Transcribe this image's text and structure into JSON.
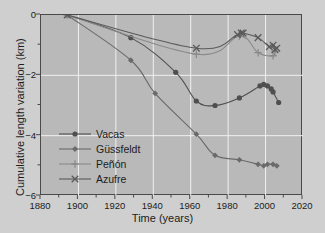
{
  "chart_data": {
    "type": "line",
    "title": "",
    "xlabel": "Time (years)",
    "ylabel": "Cumulative length variation (km)",
    "xlim": [
      1880,
      2020
    ],
    "ylim": [
      -6,
      0
    ],
    "xticks": [
      1880,
      1900,
      1920,
      1940,
      1960,
      1980,
      2000,
      2020
    ],
    "yticks": [
      0,
      -2,
      -4,
      -6
    ],
    "yminorticks": [
      -1,
      -3,
      -5
    ],
    "grid": true,
    "legend_position": "lower left",
    "series": [
      {
        "name": "Vacas",
        "marker": "circle",
        "color": "#4f4f4f",
        "points": [
          [
            1894,
            0.0
          ],
          [
            1928,
            -0.75
          ],
          [
            1952,
            -1.9
          ],
          [
            1963,
            -2.85
          ],
          [
            1973,
            -3.0
          ],
          [
            1986,
            -2.75
          ],
          [
            1997,
            -2.35
          ],
          [
            1999,
            -2.3
          ],
          [
            2001,
            -2.35
          ],
          [
            2003,
            -2.45
          ],
          [
            2004,
            -2.55
          ],
          [
            2007,
            -2.9
          ]
        ]
      },
      {
        "name": "Güssfeldt",
        "marker": "diamond",
        "color": "#6a6a6a",
        "points": [
          [
            1894,
            0.0
          ],
          [
            1928,
            -1.5
          ],
          [
            1941,
            -2.6
          ],
          [
            1963,
            -3.95
          ],
          [
            1973,
            -4.65
          ],
          [
            1986,
            -4.8
          ],
          [
            1996,
            -4.95
          ],
          [
            1999,
            -5.0
          ],
          [
            2001,
            -4.95
          ],
          [
            2004,
            -4.95
          ],
          [
            2006,
            -5.0
          ]
        ]
      },
      {
        "name": "Peñón",
        "marker": "plus",
        "color": "#8a8a8a",
        "points": [
          [
            1894,
            0.0
          ],
          [
            1963,
            -1.3
          ],
          [
            1986,
            -0.7
          ],
          [
            1996,
            -1.25
          ],
          [
            2004,
            -1.35
          ],
          [
            2005,
            -1.2
          ]
        ]
      },
      {
        "name": "Azufre",
        "marker": "x",
        "color": "#5a5a5a",
        "points": [
          [
            1894,
            0.0
          ],
          [
            1963,
            -1.1
          ],
          [
            1985,
            -0.65
          ],
          [
            1987,
            -0.6
          ],
          [
            1988,
            -0.6
          ],
          [
            1996,
            -0.75
          ],
          [
            2002,
            -1.05
          ],
          [
            2004,
            -1.0
          ],
          [
            2005,
            -1.15
          ],
          [
            2006,
            -1.1
          ]
        ]
      }
    ]
  },
  "axes": {
    "xlabel": "Time (years)",
    "ylabel": "Cumulative length variation (km)",
    "xticklabels": [
      "1880",
      "1900",
      "1920",
      "1940",
      "1960",
      "1980",
      "2000",
      "2020"
    ],
    "yticklabels": [
      "0",
      "−2",
      "−4",
      "−6"
    ]
  },
  "legend": {
    "items": [
      {
        "label": "Vacas"
      },
      {
        "label": "Güssfeldt"
      },
      {
        "label": "Peñón"
      },
      {
        "label": "Azufre"
      }
    ]
  },
  "colors": {
    "figure_background": "#cfcfcf",
    "axes_background": "#b9b9b9",
    "grid": "#f0f0f0",
    "frame": "#4a4a4a",
    "text": "#1c1c1c"
  }
}
